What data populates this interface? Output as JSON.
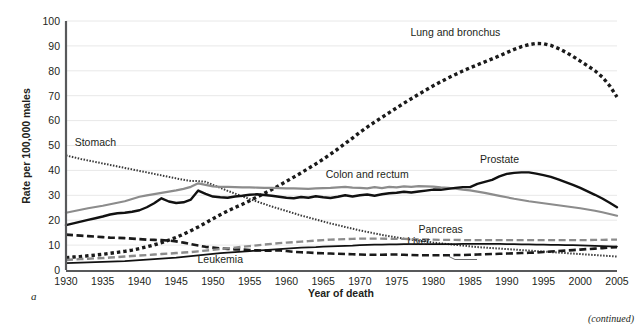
{
  "figure": {
    "panel_letter": "a",
    "continued_note": "(continued)"
  },
  "chart_data": {
    "type": "line",
    "title": "",
    "xlabel": "Year of death",
    "ylabel": "Rate per 100,000 males",
    "xlim": [
      1930,
      2005
    ],
    "ylim": [
      0,
      100
    ],
    "grid": true,
    "legend_position": "inline-annotations",
    "xticks": [
      "1930",
      "1935",
      "1940",
      "1945",
      "1950",
      "1955",
      "1960",
      "1965",
      "1970",
      "1975",
      "1980",
      "1985",
      "1990",
      "1995",
      "2000",
      "2005"
    ],
    "yticks": [
      "0",
      "10",
      "20",
      "30",
      "40",
      "50",
      "60",
      "70",
      "80",
      "90",
      "100"
    ],
    "x": [
      1930,
      1931,
      1932,
      1933,
      1934,
      1935,
      1936,
      1937,
      1938,
      1939,
      1940,
      1941,
      1942,
      1943,
      1944,
      1945,
      1946,
      1947,
      1948,
      1949,
      1950,
      1951,
      1952,
      1953,
      1954,
      1955,
      1956,
      1957,
      1958,
      1959,
      1960,
      1961,
      1962,
      1963,
      1964,
      1965,
      1966,
      1967,
      1968,
      1969,
      1970,
      1971,
      1972,
      1973,
      1974,
      1975,
      1976,
      1977,
      1978,
      1979,
      1980,
      1981,
      1982,
      1983,
      1984,
      1985,
      1986,
      1987,
      1988,
      1989,
      1990,
      1991,
      1992,
      1993,
      1994,
      1995,
      1996,
      1997,
      1998,
      1999,
      2000,
      2001,
      2002,
      2003,
      2004,
      2005
    ],
    "series": [
      {
        "name": "Lung and bronchus",
        "style": "bold-dotted",
        "color": "#1a1a1a",
        "label_x": 1983,
        "label_y": 94,
        "values": [
          4.9,
          5.2,
          5.4,
          5.7,
          6.0,
          6.3,
          6.7,
          7.1,
          7.5,
          8.0,
          8.6,
          9.3,
          10.1,
          11.0,
          12.0,
          13.1,
          14.4,
          15.8,
          17.3,
          18.9,
          20.6,
          22.2,
          23.7,
          25.1,
          26.4,
          27.8,
          29.3,
          30.8,
          32.3,
          33.9,
          35.6,
          37.3,
          39.0,
          40.8,
          42.6,
          44.5,
          46.5,
          48.6,
          50.8,
          53.0,
          55.3,
          57.4,
          59.4,
          61.3,
          63.2,
          65.1,
          67.0,
          68.8,
          70.6,
          72.3,
          74.0,
          75.6,
          77.1,
          78.5,
          79.9,
          81.2,
          82.4,
          83.6,
          84.8,
          86.0,
          87.3,
          88.6,
          89.7,
          90.5,
          91.0,
          90.9,
          90.2,
          89.0,
          87.5,
          85.8,
          83.9,
          82.0,
          80.0,
          77.5,
          74.0,
          69.5
        ]
      },
      {
        "name": "Stomach",
        "style": "fine-dotted",
        "color": "#3a3a3a",
        "label_x": 1934,
        "label_y": 50,
        "values": [
          46.0,
          45.3,
          44.6,
          44.0,
          43.4,
          42.8,
          42.2,
          41.6,
          41.0,
          40.4,
          39.8,
          39.2,
          38.6,
          38.0,
          37.4,
          36.8,
          36.2,
          35.7,
          35.7,
          35.4,
          34.2,
          33.0,
          31.8,
          30.7,
          29.6,
          28.5,
          27.5,
          26.5,
          25.5,
          24.6,
          23.7,
          22.8,
          21.9,
          21.1,
          20.3,
          19.5,
          18.7,
          18.0,
          17.3,
          16.6,
          15.9,
          15.3,
          14.7,
          14.1,
          13.6,
          13.1,
          12.6,
          12.2,
          11.8,
          11.4,
          11.0,
          10.7,
          10.4,
          10.1,
          9.8,
          9.5,
          9.2,
          9.0,
          8.8,
          8.6,
          8.4,
          8.2,
          8.0,
          7.8,
          7.6,
          7.4,
          7.2,
          7.0,
          6.8,
          6.6,
          6.4,
          6.2,
          6.0,
          5.8,
          5.6,
          5.4
        ]
      },
      {
        "name": "Colon and rectum",
        "style": "solid-gray",
        "color": "#8c8c8c",
        "label_x": 1971,
        "label_y": 37,
        "values": [
          23.0,
          23.6,
          24.2,
          24.8,
          25.3,
          25.8,
          26.4,
          27.0,
          27.6,
          28.5,
          29.4,
          30.0,
          30.5,
          31.0,
          31.5,
          32.0,
          32.6,
          33.4,
          34.8,
          34.2,
          33.6,
          33.4,
          33.4,
          33.3,
          33.2,
          33.2,
          33.1,
          33.0,
          33.0,
          32.9,
          32.8,
          32.8,
          32.7,
          32.6,
          32.8,
          32.9,
          33.0,
          33.2,
          33.4,
          33.1,
          33.0,
          32.8,
          33.3,
          32.9,
          33.4,
          33.2,
          33.6,
          33.4,
          33.7,
          33.6,
          33.5,
          33.2,
          33.0,
          32.7,
          32.3,
          32.0,
          31.5,
          31.0,
          30.4,
          29.8,
          29.2,
          28.6,
          28.1,
          27.6,
          27.2,
          26.8,
          26.4,
          26.0,
          25.6,
          25.2,
          24.8,
          24.3,
          23.8,
          23.2,
          22.5,
          21.8
        ]
      },
      {
        "name": "Prostate",
        "style": "solid-black",
        "color": "#111111",
        "label_x": 1989,
        "label_y": 43,
        "values": [
          18.0,
          18.7,
          19.4,
          20.1,
          20.8,
          21.5,
          22.3,
          22.8,
          23.0,
          23.4,
          24.0,
          25.2,
          26.8,
          28.8,
          27.5,
          26.9,
          27.2,
          28.3,
          31.9,
          30.6,
          29.5,
          29.2,
          29.0,
          29.5,
          29.8,
          30.2,
          30.4,
          30.1,
          29.8,
          29.4,
          29.0,
          28.8,
          29.3,
          29.0,
          29.6,
          29.2,
          28.9,
          29.4,
          30.0,
          29.5,
          30.0,
          30.3,
          29.8,
          30.4,
          30.8,
          31.0,
          31.4,
          31.1,
          31.5,
          31.9,
          32.3,
          32.2,
          32.6,
          33.0,
          33.3,
          33.3,
          34.6,
          35.4,
          36.2,
          37.6,
          38.6,
          39.0,
          39.2,
          39.2,
          38.7,
          38.1,
          37.4,
          36.4,
          35.3,
          34.2,
          33.0,
          31.6,
          30.2,
          28.7,
          27.0,
          25.2
        ]
      },
      {
        "name": "Liver",
        "style": "dashed-black",
        "color": "#1a1a1a",
        "label_x": 1978,
        "label_y": 10,
        "values": [
          14.2,
          14.0,
          13.8,
          13.6,
          13.4,
          13.2,
          13.0,
          12.9,
          12.8,
          12.6,
          12.4,
          12.2,
          12.1,
          12.0,
          11.8,
          11.5,
          11.0,
          10.4,
          9.8,
          9.3,
          9.0,
          8.7,
          8.5,
          8.3,
          8.2,
          8.0,
          7.9,
          7.8,
          7.8,
          7.9,
          7.6,
          7.3,
          7.1,
          7.0,
          6.8,
          6.7,
          6.6,
          6.5,
          6.4,
          6.3,
          6.2,
          6.1,
          6.1,
          6.1,
          6.2,
          6.2,
          6.1,
          6.0,
          5.9,
          5.9,
          5.9,
          5.9,
          5.9,
          6.0,
          6.0,
          6.1,
          6.2,
          6.3,
          6.4,
          6.5,
          6.6,
          6.7,
          6.8,
          6.9,
          7.0,
          7.2,
          7.4,
          7.6,
          7.8,
          8.0,
          8.2,
          8.4,
          8.6,
          8.8,
          9.0,
          9.2
        ]
      },
      {
        "name": "Pancreas",
        "style": "dashed-gray",
        "color": "#8c8c8c",
        "label_x": 1981,
        "label_y": 15,
        "values": [
          4.0,
          4.2,
          4.4,
          4.5,
          4.7,
          4.8,
          5.0,
          5.2,
          5.4,
          5.6,
          5.8,
          6.0,
          6.2,
          6.4,
          6.6,
          6.8,
          7.0,
          7.2,
          7.5,
          7.8,
          8.1,
          8.4,
          8.7,
          9.0,
          9.3,
          9.6,
          9.9,
          10.2,
          10.5,
          10.8,
          11.0,
          11.2,
          11.4,
          11.6,
          11.8,
          12.0,
          12.2,
          12.3,
          12.4,
          12.5,
          12.6,
          12.6,
          12.6,
          12.6,
          12.5,
          12.5,
          12.5,
          12.4,
          12.3,
          12.3,
          12.2,
          12.1,
          12.1,
          12.1,
          12.0,
          12.0,
          12.0,
          12.0,
          12.0,
          12.0,
          12.0,
          12.0,
          12.0,
          12.0,
          12.0,
          12.0,
          12.0,
          12.0,
          12.0,
          12.0,
          12.0,
          12.0,
          12.1,
          12.1,
          12.2,
          12.2
        ]
      },
      {
        "name": "Leukemia",
        "style": "thin-solid-black",
        "color": "#111111",
        "label_x": 1951,
        "label_y": 3,
        "values": [
          2.8,
          2.9,
          3.0,
          3.1,
          3.2,
          3.3,
          3.4,
          3.5,
          3.6,
          3.8,
          4.0,
          4.2,
          4.4,
          4.6,
          4.8,
          5.0,
          5.3,
          5.6,
          5.9,
          6.2,
          6.5,
          6.8,
          7.0,
          7.2,
          7.4,
          7.6,
          7.8,
          8.0,
          8.2,
          8.4,
          8.6,
          8.8,
          9.0,
          9.1,
          9.2,
          9.4,
          9.5,
          9.6,
          9.7,
          9.8,
          10.0,
          10.1,
          10.2,
          10.2,
          10.3,
          10.3,
          10.4,
          10.4,
          10.4,
          10.4,
          10.4,
          10.4,
          10.4,
          10.4,
          10.5,
          10.5,
          10.5,
          10.5,
          10.5,
          10.5,
          10.4,
          10.4,
          10.3,
          10.3,
          10.2,
          10.2,
          10.1,
          10.1,
          10.0,
          10.0,
          9.9,
          9.8,
          9.7,
          9.6,
          9.5,
          9.4
        ]
      }
    ]
  }
}
